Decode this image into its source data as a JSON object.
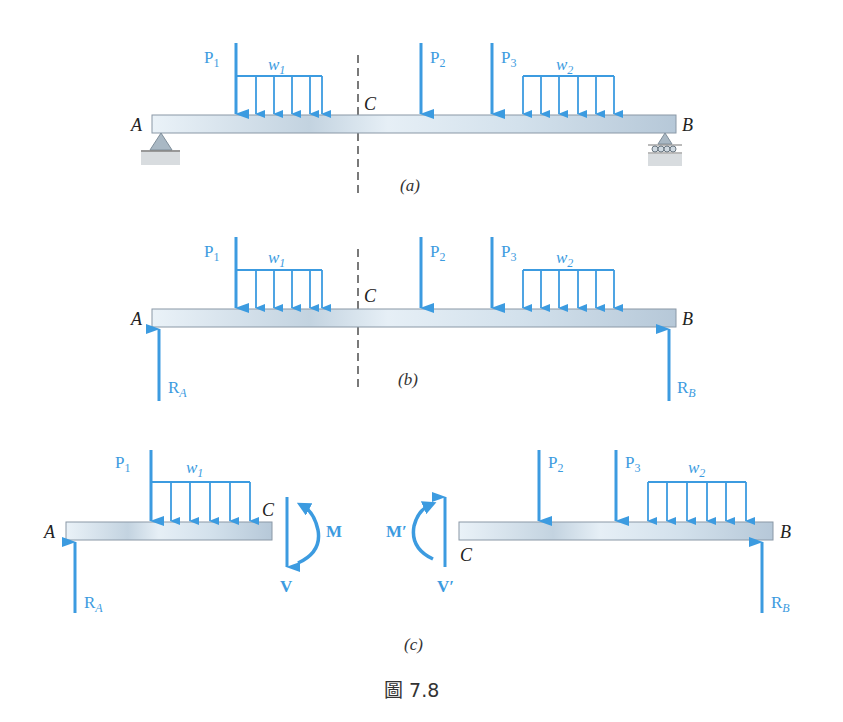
{
  "figure": {
    "caption": "圖 7.8",
    "colors": {
      "force": "#3c9be0",
      "beam_light": "#e4eef6",
      "beam_dark": "#b8cadb",
      "text": "#222222"
    },
    "panels": [
      {
        "id": "a",
        "label": "(a)",
        "points": {
          "A": "A",
          "B": "B",
          "C": "C"
        },
        "loads": {
          "P1": "P",
          "P1_sub": "1",
          "P2": "P",
          "P2_sub": "2",
          "P3": "P",
          "P3_sub": "3",
          "w1": "w",
          "w1_sub": "1",
          "w2": "w",
          "w2_sub": "2"
        },
        "supports": [
          "pin-at-A",
          "roller-at-B"
        ]
      },
      {
        "id": "b",
        "label": "(b)",
        "points": {
          "A": "A",
          "B": "B",
          "C": "C"
        },
        "loads": {
          "P1": "P",
          "P1_sub": "1",
          "P2": "P",
          "P2_sub": "2",
          "P3": "P",
          "P3_sub": "3",
          "w1": "w",
          "w1_sub": "1",
          "w2": "w",
          "w2_sub": "2"
        },
        "reactions": {
          "RA": "R",
          "RA_sub": "A",
          "RB": "R",
          "RB_sub": "B"
        }
      },
      {
        "id": "c",
        "label": "(c)",
        "left": {
          "A": "A",
          "C": "C",
          "P1": "P",
          "P1_sub": "1",
          "w1": "w",
          "w1_sub": "1",
          "RA": "R",
          "RA_sub": "A",
          "V": "V",
          "M": "M"
        },
        "right": {
          "B": "B",
          "C": "C",
          "P2": "P",
          "P2_sub": "2",
          "P3": "P",
          "P3_sub": "3",
          "w2": "w",
          "w2_sub": "2",
          "RB": "R",
          "RB_sub": "B",
          "Vp": "V′",
          "Mp": "M′"
        }
      }
    ]
  }
}
